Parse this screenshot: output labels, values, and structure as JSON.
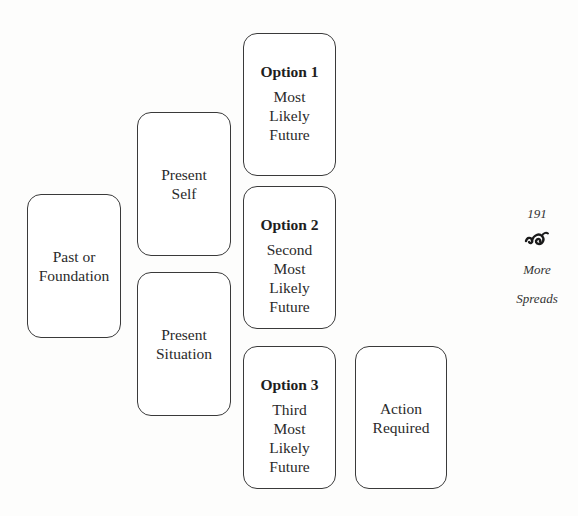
{
  "diagram": {
    "type": "tarot-spread-layout",
    "cards": [
      {
        "id": "past",
        "title": "",
        "lines": [
          "Past or",
          "Foundation"
        ]
      },
      {
        "id": "present-self",
        "title": "",
        "lines": [
          "Present",
          "Self"
        ]
      },
      {
        "id": "present-situation",
        "title": "",
        "lines": [
          "Present",
          "Situation"
        ]
      },
      {
        "id": "option-1",
        "title": "Option 1",
        "lines": [
          "Most",
          "Likely",
          "Future"
        ]
      },
      {
        "id": "option-2",
        "title": "Option 2",
        "lines": [
          "Second",
          "Most",
          "Likely",
          "Future"
        ]
      },
      {
        "id": "option-3",
        "title": "Option 3",
        "lines": [
          "Third",
          "Most",
          "Likely",
          "Future"
        ]
      },
      {
        "id": "action",
        "title": "",
        "lines": [
          "Action",
          "Required"
        ]
      }
    ]
  },
  "margin": {
    "page_number": "191",
    "ornament_icon": "fleuron-icon",
    "section_line1": "More",
    "section_line2": "Spreads"
  },
  "colors": {
    "card_border": "#3a3a3a",
    "text": "#2a2a2a",
    "background": "#ffffff"
  }
}
